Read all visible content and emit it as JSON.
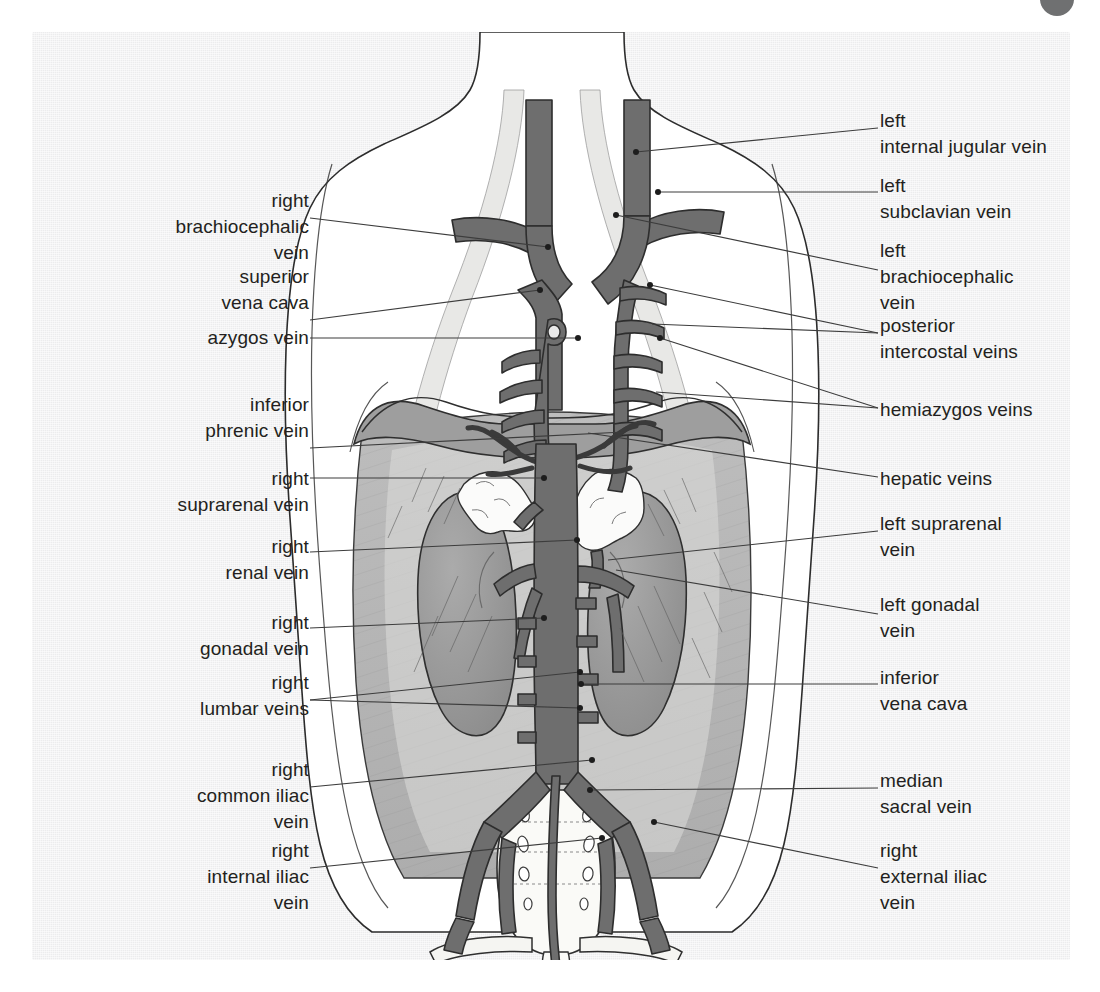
{
  "page": {
    "background_color": "#ffffff",
    "paper_color": "#ececed",
    "corner_tab_color": "#6f7071"
  },
  "figure": {
    "type": "anatomical-illustration",
    "ink_color": "#231f20",
    "vein_fill_color": "#6e6e6e",
    "vein_outline_color": "#3a3a3a",
    "muscle_fill_color": "#b6b6b6",
    "kidney_fill_color": "#9a9a9a",
    "bone_fill_color": "#f7f7f5",
    "leader_line_color": "#4a4a4a"
  },
  "labels": {
    "left": [
      {
        "id": "right-brachiocephalic-vein",
        "lines": [
          "right",
          "brachiocephalic",
          "vein"
        ],
        "x": 64,
        "y": 188,
        "width": 245,
        "leader_from_y": 218,
        "leader_to_x": 516,
        "leader_to_y": 247
      },
      {
        "id": "superior-vena-cava",
        "lines": [
          "superior",
          "vena cava"
        ],
        "x": 64,
        "y": 264,
        "width": 245,
        "leader_from_y": 320,
        "leader_to_x": 508,
        "leader_to_y": 290
      },
      {
        "id": "azygos-vein",
        "lines": [
          "azygos vein"
        ],
        "x": 64,
        "y": 325,
        "width": 245,
        "leader_from_y": 338,
        "leader_to_x": 546,
        "leader_to_y": 338
      },
      {
        "id": "inferior-phrenic-vein",
        "lines": [
          "inferior",
          "phrenic vein"
        ],
        "x": 64,
        "y": 392,
        "width": 245,
        "leader_from_y": 448,
        "leader_to_x": 592,
        "leader_to_y": 432
      },
      {
        "id": "right-suprarenal-vein",
        "lines": [
          "right",
          "suprarenal vein"
        ],
        "x": 64,
        "y": 466,
        "width": 245,
        "leader_from_y": 478,
        "leader_to_x": 512,
        "leader_to_y": 478
      },
      {
        "id": "right-renal-vein",
        "lines": [
          "right",
          "renal vein"
        ],
        "x": 64,
        "y": 534,
        "width": 245,
        "leader_from_y": 552,
        "leader_to_x": 545,
        "leader_to_y": 540
      },
      {
        "id": "right-gonadal-vein",
        "lines": [
          "right",
          "gonadal vein"
        ],
        "x": 64,
        "y": 610,
        "width": 245,
        "leader_from_y": 628,
        "leader_to_x": 512,
        "leader_to_y": 618
      },
      {
        "id": "right-lumbar-veins",
        "lines": [
          "right",
          "lumbar veins"
        ],
        "x": 64,
        "y": 670,
        "width": 245,
        "leader_from_y": 700,
        "leader_to_x": 548,
        "leader_to_y": 672
      },
      {
        "id": "right-common-iliac-vein",
        "lines": [
          "right",
          "common iliac",
          "vein"
        ],
        "x": 64,
        "y": 757,
        "width": 245,
        "leader_from_y": 787,
        "leader_to_x": 560,
        "leader_to_y": 760
      },
      {
        "id": "right-internal-iliac-vein",
        "lines": [
          "right",
          "internal iliac",
          "vein"
        ],
        "x": 64,
        "y": 838,
        "width": 245,
        "leader_from_y": 868,
        "leader_to_x": 570,
        "leader_to_y": 838
      }
    ],
    "right": [
      {
        "id": "left-internal-jugular-vein",
        "lines": [
          "left",
          "internal jugular vein"
        ],
        "x": 880,
        "y": 108,
        "leader_from_y": 128,
        "leader_to_x": 600,
        "leader_to_y": 152
      },
      {
        "id": "left-subclavian-vein",
        "lines": [
          "left",
          "subclavian vein"
        ],
        "x": 880,
        "y": 173,
        "leader_from_y": 192,
        "leader_to_x": 622,
        "leader_to_y": 192
      },
      {
        "id": "left-brachiocephalic-vein",
        "lines": [
          "left",
          "brachiocephalic",
          "vein"
        ],
        "x": 880,
        "y": 238,
        "leader_from_y": 270,
        "leader_to_x": 580,
        "leader_to_y": 215
      },
      {
        "id": "posterior-intercostal-veins",
        "lines": [
          "posterior",
          "intercostal veins"
        ],
        "x": 880,
        "y": 313,
        "leader_from_y": 333,
        "leader_to_x": 614,
        "leader_to_y": 285
      },
      {
        "id": "hemiazygos-veins",
        "lines": [
          "hemiazygos veins"
        ],
        "x": 880,
        "y": 397,
        "leader_from_y": 408,
        "leader_to_x": 626,
        "leader_to_y": 338
      },
      {
        "id": "hepatic-veins",
        "lines": [
          "hepatic veins"
        ],
        "x": 880,
        "y": 466,
        "leader_from_y": 477,
        "leader_to_x": 552,
        "leader_to_y": 433
      },
      {
        "id": "left-suprarenal-vein",
        "lines": [
          "left suprarenal",
          "vein"
        ],
        "x": 880,
        "y": 511,
        "leader_from_y": 531,
        "leader_to_x": 572,
        "leader_to_y": 560
      },
      {
        "id": "left-gonadal-vein",
        "lines": [
          "left gonadal",
          "vein"
        ],
        "x": 880,
        "y": 592,
        "leader_from_y": 614,
        "leader_to_x": 580,
        "leader_to_y": 570
      },
      {
        "id": "inferior-vena-cava",
        "lines": [
          "inferior",
          "vena cava"
        ],
        "x": 880,
        "y": 665,
        "leader_from_y": 684,
        "leader_to_x": 549,
        "leader_to_y": 684
      },
      {
        "id": "median-sacral-vein",
        "lines": [
          "median",
          "sacral vein"
        ],
        "x": 880,
        "y": 768,
        "leader_from_y": 788,
        "leader_to_x": 556,
        "leader_to_y": 790
      },
      {
        "id": "right-external-iliac-vein",
        "lines": [
          "right",
          "external iliac",
          "vein"
        ],
        "x": 880,
        "y": 838,
        "leader_from_y": 868,
        "leader_to_x": 618,
        "leader_to_y": 822
      }
    ]
  },
  "structures": [
    {
      "name": "left internal jugular vein",
      "side": "left"
    },
    {
      "name": "right internal jugular vein",
      "side": "right"
    },
    {
      "name": "left subclavian vein",
      "side": "left"
    },
    {
      "name": "right subclavian vein",
      "side": "right"
    },
    {
      "name": "left brachiocephalic vein",
      "side": "left"
    },
    {
      "name": "right brachiocephalic vein",
      "side": "right"
    },
    {
      "name": "superior vena cava",
      "side": "midline"
    },
    {
      "name": "azygos vein",
      "side": "right"
    },
    {
      "name": "hemiazygos veins",
      "side": "left"
    },
    {
      "name": "posterior intercostal veins",
      "side": "both"
    },
    {
      "name": "hepatic veins",
      "side": "midline"
    },
    {
      "name": "inferior phrenic vein",
      "side": "both"
    },
    {
      "name": "right suprarenal vein",
      "side": "right"
    },
    {
      "name": "left suprarenal vein",
      "side": "left"
    },
    {
      "name": "right renal vein",
      "side": "right"
    },
    {
      "name": "left renal vein",
      "side": "left"
    },
    {
      "name": "right gonadal vein",
      "side": "right"
    },
    {
      "name": "left gonadal vein",
      "side": "left"
    },
    {
      "name": "lumbar veins",
      "side": "both"
    },
    {
      "name": "inferior vena cava",
      "side": "midline"
    },
    {
      "name": "median sacral vein",
      "side": "midline"
    },
    {
      "name": "common iliac vein",
      "side": "both"
    },
    {
      "name": "external iliac vein",
      "side": "both"
    },
    {
      "name": "internal iliac vein",
      "side": "both"
    },
    {
      "name": "kidney",
      "side": "both"
    },
    {
      "name": "suprarenal gland",
      "side": "both"
    },
    {
      "name": "diaphragm",
      "side": "midline"
    },
    {
      "name": "sacrum",
      "side": "midline"
    },
    {
      "name": "psoas major muscle",
      "side": "both"
    }
  ]
}
